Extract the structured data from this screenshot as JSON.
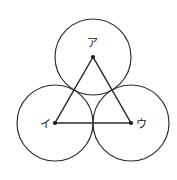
{
  "figure": {
    "canvas": {
      "width": 177,
      "height": 180,
      "background": "#ffffff"
    },
    "stroke_color": "#2b2b2b",
    "label_color": "#1a1a1a",
    "circles": [
      {
        "id": "circle-a",
        "label": "ア",
        "cx": 93,
        "cy": 57,
        "r": 38
      },
      {
        "id": "circle-i",
        "label": "イ",
        "cx": 55,
        "cy": 123,
        "r": 38
      },
      {
        "id": "circle-u",
        "label": "ウ",
        "cx": 131,
        "cy": 123,
        "r": 38
      }
    ],
    "triangle": {
      "points": "93,57 55,123 131,123",
      "vertices": [
        {
          "id": "vertex-a",
          "label": "ア",
          "x": 93,
          "y": 57
        },
        {
          "id": "vertex-i",
          "label": "イ",
          "x": 55,
          "y": 123
        },
        {
          "id": "vertex-u",
          "label": "ウ",
          "x": 131,
          "y": 123
        }
      ]
    },
    "labels": [
      {
        "id": "label-a",
        "text": "ア",
        "left": 87,
        "top": 38
      },
      {
        "id": "label-i",
        "text": "イ",
        "left": 40,
        "top": 119
      },
      {
        "id": "label-u",
        "text": "ウ",
        "left": 136,
        "top": 119
      }
    ]
  }
}
